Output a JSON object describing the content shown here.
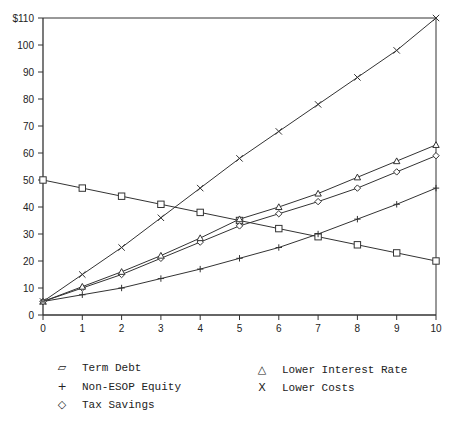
{
  "chart_data": {
    "type": "line",
    "title": "",
    "xlabel": "Years",
    "ylabel": "",
    "x": [
      0,
      1,
      2,
      3,
      4,
      5,
      6,
      7,
      8,
      9,
      10
    ],
    "xlim": [
      0,
      10
    ],
    "ylim": [
      0,
      110
    ],
    "y_ticks": [
      "0",
      "10",
      "20",
      "30",
      "40",
      "50",
      "60",
      "70",
      "80",
      "90",
      "100",
      "$110"
    ],
    "x_ticks": [
      "0",
      "1",
      "2",
      "3",
      "4",
      "5",
      "6",
      "7",
      "8",
      "9",
      "10"
    ],
    "grid": false,
    "legend_position": "bottom",
    "series": [
      {
        "name": "Term Debt",
        "marker": "square",
        "values": [
          50,
          47,
          44,
          41,
          38,
          35,
          32,
          29,
          26,
          23,
          20
        ]
      },
      {
        "name": "Non-ESOP Equity",
        "marker": "plus",
        "values": [
          5,
          7.5,
          10,
          13.5,
          17,
          21,
          25,
          30,
          35.5,
          41,
          47
        ]
      },
      {
        "name": "Tax Savings",
        "marker": "diamond",
        "values": [
          5,
          10,
          15,
          21,
          27,
          33,
          37.5,
          42,
          47,
          53,
          59
        ]
      },
      {
        "name": "Lower Interest Rate",
        "marker": "triangle",
        "values": [
          5,
          10.5,
          16,
          22,
          28.5,
          35.5,
          40,
          45,
          51,
          57,
          63
        ]
      },
      {
        "name": "Lower Costs",
        "marker": "x",
        "values": [
          5,
          15,
          25,
          36,
          47,
          58,
          68,
          78,
          88,
          98,
          110
        ]
      }
    ]
  },
  "legend": {
    "items": [
      {
        "symbol": "▱",
        "label": "Term Debt"
      },
      {
        "symbol": "+",
        "label": "Non-ESOP Equity"
      },
      {
        "symbol": "◇",
        "label": "Tax Savings"
      },
      {
        "symbol": "△",
        "label": "Lower Interest Rate"
      },
      {
        "symbol": "X",
        "label": "Lower Costs"
      }
    ]
  }
}
